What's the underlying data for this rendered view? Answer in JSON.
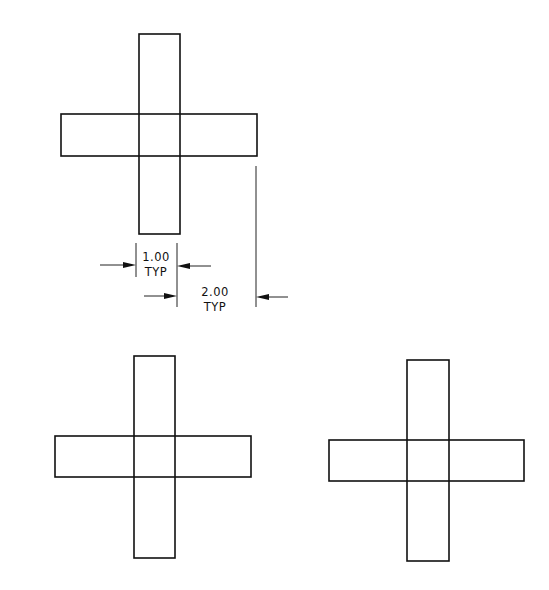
{
  "diagram": {
    "type": "technical-drawing",
    "figures": [
      {
        "id": "cross-top",
        "vertical_bar": {
          "x": 139,
          "y": 34,
          "w": 41,
          "h": 200
        },
        "horizontal_bar": {
          "x": 61,
          "y": 114,
          "w": 196,
          "h": 42
        }
      },
      {
        "id": "cross-bottom-left",
        "vertical_bar": {
          "x": 134,
          "y": 356,
          "w": 41,
          "h": 202
        },
        "horizontal_bar": {
          "x": 55,
          "y": 436,
          "w": 196,
          "h": 41
        }
      },
      {
        "id": "cross-bottom-right",
        "vertical_bar": {
          "x": 407,
          "y": 360,
          "w": 42,
          "h": 201
        },
        "horizontal_bar": {
          "x": 329,
          "y": 440,
          "w": 195,
          "h": 41
        }
      }
    ],
    "dimensions": [
      {
        "id": "width-dimension",
        "value": "1.00",
        "qualifier": "TYP"
      },
      {
        "id": "arm-dimension",
        "value": "2.00",
        "qualifier": "TYP"
      }
    ]
  }
}
